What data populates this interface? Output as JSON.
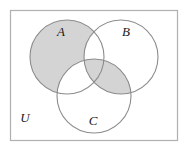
{
  "figure": {
    "type": "venn-diagram",
    "sets_count": 3,
    "universe": {
      "label": "U",
      "label_x": 25,
      "label_y": 122,
      "rect": {
        "x": 10.5,
        "y": 10.5,
        "width": 167,
        "height": 130
      },
      "border_color": "#b0b0b0",
      "fill_color": "#ffffff"
    },
    "circles": [
      {
        "id": "A",
        "label": "A",
        "cx": 67,
        "cy": 57,
        "r": 37,
        "label_x": 61,
        "label_y": 36
      },
      {
        "id": "B",
        "label": "B",
        "cx": 121,
        "cy": 57,
        "r": 37,
        "label_x": 126,
        "label_y": 36
      },
      {
        "id": "C",
        "label": "C",
        "cx": 94,
        "cy": 96,
        "r": 37,
        "label_x": 93,
        "label_y": 125
      }
    ],
    "circle_stroke_color": "#8c8c8c",
    "shaded_color": "#d4d4d4",
    "shaded_regions": [
      {
        "id": "A-only",
        "description": "A minus B minus C",
        "shaded": true
      },
      {
        "id": "B-only",
        "description": "B minus A minus C",
        "shaded": false
      },
      {
        "id": "C-only",
        "description": "C minus A minus B",
        "shaded": false
      },
      {
        "id": "A-and-B",
        "description": "A intersect B minus C",
        "shaded": false
      },
      {
        "id": "A-and-C",
        "description": "A intersect C minus B",
        "shaded": false
      },
      {
        "id": "B-and-C",
        "description": "B intersect C minus A",
        "shaded": true
      },
      {
        "id": "A-and-B-and-C",
        "description": "A intersect B intersect C",
        "shaded": true
      }
    ]
  }
}
